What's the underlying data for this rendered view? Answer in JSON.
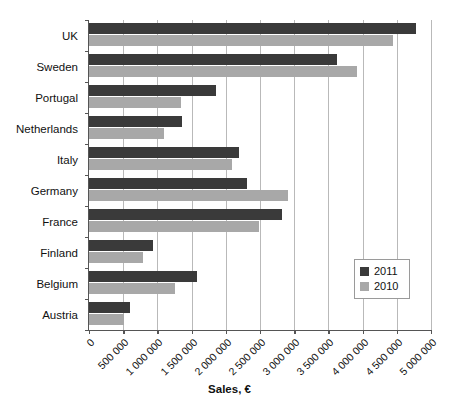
{
  "chart_data": {
    "type": "bar",
    "orientation": "horizontal",
    "title": "",
    "xlabel": "Sales, €",
    "ylabel": "",
    "xlim": [
      0,
      5000000
    ],
    "grid": true,
    "legend_position": "inside-right",
    "categories": [
      "UK",
      "Sweden",
      "Portugal",
      "Netherlands",
      "Italy",
      "Germany",
      "France",
      "Finland",
      "Belgium",
      "Austria"
    ],
    "xticks": [
      0,
      500000,
      1000000,
      1500000,
      2000000,
      2500000,
      3000000,
      3500000,
      4000000,
      4500000,
      5000000
    ],
    "xticklabels": [
      "0",
      "500 000",
      "1 000 000",
      "1 500 000",
      "2 000 000",
      "2 500 000",
      "3 000 000",
      "3 500 000",
      "4 000 000",
      "4 500 000",
      "5 000 000"
    ],
    "series": [
      {
        "name": "2011",
        "color": "#3a3a3a",
        "values": [
          4780000,
          3620000,
          1860000,
          1360000,
          2190000,
          2310000,
          2820000,
          940000,
          1580000,
          600000
        ]
      },
      {
        "name": "2010",
        "color": "#a8a8a8",
        "values": [
          4440000,
          3920000,
          1350000,
          1100000,
          2090000,
          2910000,
          2480000,
          790000,
          1260000,
          510000
        ]
      }
    ]
  },
  "legend": {
    "items": [
      {
        "label": "2011",
        "color": "#3a3a3a"
      },
      {
        "label": "2010",
        "color": "#a8a8a8"
      }
    ]
  },
  "axis": {
    "x_title": "Sales, €"
  },
  "colors": {
    "series_2011": "#3a3a3a",
    "series_2010": "#a8a8a8",
    "gridline": "#b9b9b9",
    "axis": "#555555",
    "background": "#ffffff"
  }
}
